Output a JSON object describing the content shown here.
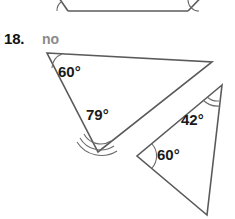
{
  "problem": {
    "number_label": "18.",
    "answer_label": "no"
  },
  "colors": {
    "shape_stroke": "#5a5a5a",
    "arc_stroke": "#6b6b6b",
    "label_text": "#1a1a1a",
    "number_text": "#111111",
    "answer_text": "#8a8a8a",
    "background": "#ffffff"
  },
  "figure": {
    "type": "geometry-similar-triangles",
    "partial_shape_above": {
      "name": "cut-off-shape-top",
      "description": "bottom portion of a wide flat triangle from the previous problem, clipped by the top edge",
      "points": "48,-18 68,11 188,11 212,-14",
      "baseline": "68,11 188,11",
      "left_edge": "48,-18 68,11",
      "right_edge": "188,11 212,-14",
      "arcs": [
        {
          "name": "top-shape-left-arc",
          "d": "M 61,2 A 11,11 0 0 0 57,11"
        },
        {
          "name": "top-shape-right-arc",
          "d": "M 188,0 A 11,11 0 0 0 199,11"
        }
      ]
    },
    "triangle_large": {
      "name": "large-triangle",
      "vertices": {
        "top_left": {
          "x": 47,
          "y": 53
        },
        "right": {
          "x": 212,
          "y": 62
        },
        "bottom": {
          "x": 98,
          "y": 152
        }
      },
      "angles": [
        {
          "name": "angle-60-large",
          "value": "60°",
          "vertex": "top_left",
          "tick_marks": 1,
          "label_x": 58,
          "label_y": 77,
          "arcs": [
            "M 62,54 A 15,15 0 0 0 52,68"
          ]
        },
        {
          "name": "angle-79-large",
          "value": "79°",
          "vertex": "bottom",
          "tick_marks": 3,
          "label_x": 86,
          "label_y": 120,
          "arcs": [
            "M 84,134 A 19,19 0 0 0 111,141",
            "M 80,138 A 24,24 0 0 0 114,146",
            "M 77,142 A 29,29 0 0 0 117,151"
          ]
        }
      ]
    },
    "triangle_small": {
      "name": "small-triangle",
      "vertices": {
        "top": {
          "x": 222,
          "y": 85
        },
        "left": {
          "x": 137,
          "y": 156
        },
        "bottom": {
          "x": 207,
          "y": 215
        }
      },
      "angles": [
        {
          "name": "angle-42-small",
          "value": "42°",
          "vertex": "top",
          "tick_marks": 2,
          "label_x": 181,
          "label_y": 125,
          "arcs": [
            "M 206,97 A 17,17 0 0 0 220,102",
            "M 202,100 A 22,22 0 0 0 221,107"
          ]
        },
        {
          "name": "angle-60-small",
          "value": "60°",
          "vertex": "left",
          "tick_marks": 1,
          "label_x": 157,
          "label_y": 160,
          "arcs": [
            "M 152,144 A 18,18 0 0 1 152,168"
          ]
        }
      ]
    }
  }
}
